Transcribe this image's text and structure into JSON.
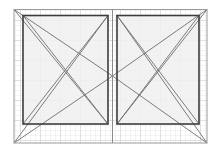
{
  "canvas": {
    "width": 221,
    "height": 153,
    "background_color": "#ffffff",
    "title": "Double casement window elevation"
  },
  "colors": {
    "background": "#ffffff",
    "grid_minor": "#e9e9e9",
    "grid_major": "#d2d2d2",
    "glass_fill": "#f0f0f0",
    "outer_frame_stroke": "#9a9a9a",
    "sash_frame_stroke": "#3c3c3c",
    "swing_line_stroke": "#6e6e6e",
    "mullion_stroke": "#8c8c8c"
  },
  "grid": {
    "minor_spacing": 5,
    "major_spacing": 20,
    "minor_width": 0.5,
    "major_width": 0.6,
    "origin_x": 14,
    "origin_y": 9,
    "extent_x": 207,
    "extent_y": 143,
    "visible": true,
    "style": "dotted-graph-paper"
  },
  "outer_frame": {
    "label": "outer-frame",
    "x": 14,
    "y": 9.5,
    "width": 193,
    "height": 133.5,
    "stroke_width": 1.0
  },
  "mullion": {
    "label": "center-mullion",
    "x": 112.5,
    "y_top": 9.5,
    "y_bottom": 143,
    "stroke_width": 1.0
  },
  "sashes": [
    {
      "id": "left-sash",
      "label": "Left casement sash",
      "x": 23,
      "y": 15.5,
      "width": 85,
      "height": 108.5,
      "stroke_width": 1.6,
      "hinge_side": "left",
      "opening": "inward",
      "glass_fill": "#f0f0f0"
    },
    {
      "id": "right-sash",
      "label": "Right casement sash",
      "x": 117,
      "y": 15.5,
      "width": 82,
      "height": 108.5,
      "stroke_width": 1.6,
      "hinge_side": "right",
      "opening": "inward",
      "glass_fill": "#f0f0f0"
    }
  ],
  "swing_indicators": {
    "label": "opening-direction-diagonals",
    "stroke_width": 0.9,
    "left_panel": [
      {
        "id": "l-diag-tl-br",
        "x1": 23,
        "y1": 15.5,
        "x2": 108,
        "y2": 124
      },
      {
        "id": "l-diag-bl-tr",
        "x1": 23,
        "y1": 124,
        "x2": 108,
        "y2": 15.5
      },
      {
        "id": "l-hinge-upper",
        "x1": 14,
        "y1": 9.5,
        "x2": 112.5,
        "y2": 76
      },
      {
        "id": "l-hinge-lower",
        "x1": 14,
        "y1": 143,
        "x2": 112.5,
        "y2": 76
      },
      {
        "id": "l-sweep-top",
        "x1": 14,
        "y1": 143,
        "x2": 108,
        "y2": 15.5
      },
      {
        "id": "l-sweep-bot",
        "x1": 14,
        "y1": 9.5,
        "x2": 108,
        "y2": 124
      }
    ],
    "right_panel": [
      {
        "id": "r-diag-tl-br",
        "x1": 117,
        "y1": 15.5,
        "x2": 199,
        "y2": 124
      },
      {
        "id": "r-diag-bl-tr",
        "x1": 117,
        "y1": 124,
        "x2": 199,
        "y2": 15.5
      },
      {
        "id": "r-hinge-upper",
        "x1": 207,
        "y1": 9.5,
        "x2": 112.5,
        "y2": 76
      },
      {
        "id": "r-hinge-lower",
        "x1": 207,
        "y1": 143,
        "x2": 112.5,
        "y2": 76
      },
      {
        "id": "r-sweep-top",
        "x1": 207,
        "y1": 143,
        "x2": 117,
        "y2": 15.5
      },
      {
        "id": "r-sweep-bot",
        "x1": 207,
        "y1": 9.5,
        "x2": 117,
        "y2": 124
      }
    ]
  }
}
